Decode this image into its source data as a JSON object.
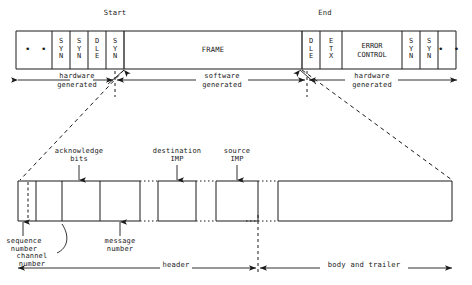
{
  "figure": {
    "title_start": "Start",
    "title_end": "End"
  },
  "frame_bar": {
    "cells": [
      {
        "id": "left-ellipsis",
        "text": "• •",
        "kind": "ellipsis"
      },
      {
        "id": "syn-1",
        "text": "S\nY\nN",
        "kind": "stack"
      },
      {
        "id": "syn-2",
        "text": "S\nY\nN",
        "kind": "stack"
      },
      {
        "id": "dle-1",
        "text": "D\nL\nE",
        "kind": "stack"
      },
      {
        "id": "syn-3",
        "text": "S\nY\nN",
        "kind": "stack"
      },
      {
        "id": "frame",
        "text": "FRAME",
        "kind": "wide"
      },
      {
        "id": "dle-2",
        "text": "D\nL\nE",
        "kind": "stack"
      },
      {
        "id": "etx",
        "text": "E\nT\nX",
        "kind": "stack"
      },
      {
        "id": "error-control",
        "text": "ERROR\nCONTROL",
        "kind": "wide2"
      },
      {
        "id": "syn-4",
        "text": "S\nY\nN",
        "kind": "stack"
      },
      {
        "id": "syn-5",
        "text": "S\nY\nN",
        "kind": "stack"
      },
      {
        "id": "right-ellipsis",
        "text": "• •",
        "kind": "ellipsis"
      }
    ]
  },
  "generation_spans": [
    {
      "id": "hardware-left",
      "line1": "hardware",
      "line2": "generated"
    },
    {
      "id": "software-middle",
      "line1": "software",
      "line2": "generated"
    },
    {
      "id": "hardware-right",
      "line1": "hardware",
      "line2": "generated"
    }
  ],
  "packet_callouts": [
    {
      "id": "acknowledge-bits",
      "line1": "acknowledge",
      "line2": "bits"
    },
    {
      "id": "destination-imp",
      "line1": "destination",
      "line2": "IMP"
    },
    {
      "id": "source-imp",
      "line1": "source",
      "line2": "IMP"
    }
  ],
  "packet_lower_labels": [
    {
      "id": "sequence-number",
      "line1": "sequence",
      "line2": "number"
    },
    {
      "id": "channel-number",
      "line1": "channel",
      "line2": "number"
    },
    {
      "id": "message-number",
      "line1": "message",
      "line2": "number"
    }
  ],
  "packet_spans": [
    {
      "id": "header-span",
      "text": "header"
    },
    {
      "id": "body-trailer-span",
      "text": "body and trailer"
    }
  ],
  "colors": {
    "ink": "#1a1a1a",
    "rule": "#1a1a1a",
    "background": "#ffffff"
  }
}
